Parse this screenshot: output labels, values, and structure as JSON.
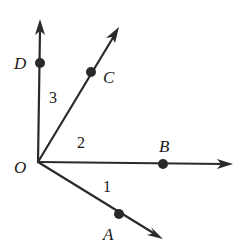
{
  "diagram": {
    "type": "angles-from-common-vertex",
    "vertex": {
      "label": "O",
      "x": 38,
      "y": 162
    },
    "rays": [
      {
        "id": "OD",
        "end": [
          40,
          20
        ],
        "point": {
          "label": "D",
          "x": 40,
          "y": 63
        }
      },
      {
        "id": "OC",
        "end": [
          119,
          28
        ],
        "point": {
          "label": "C",
          "x": 91,
          "y": 72
        }
      },
      {
        "id": "OB",
        "end": [
          232,
          164
        ],
        "point": {
          "label": "B",
          "x": 163,
          "y": 164
        }
      },
      {
        "id": "OA",
        "end": [
          162,
          239
        ],
        "point": {
          "label": "A",
          "x": 119,
          "y": 214
        }
      }
    ],
    "angle_labels": [
      {
        "label": "1",
        "between": "OB-OA"
      },
      {
        "label": "2",
        "between": "OC-OB"
      },
      {
        "label": "3",
        "between": "OD-OC"
      }
    ],
    "colors": {
      "line": "#2a2a2a",
      "text": "#1a1a1a",
      "background": "#ffffff"
    }
  },
  "labels": {
    "O": "O",
    "A": "A",
    "B": "B",
    "C": "C",
    "D": "D",
    "angle1": "1",
    "angle2": "2",
    "angle3": "3"
  }
}
